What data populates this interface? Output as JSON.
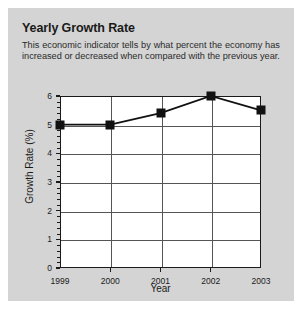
{
  "panel": {
    "title": "Yearly Growth Rate",
    "description_line1": "This economic indicator tells by what percent the economy has",
    "description_line2": "increased or decreased when compared with the previous year.",
    "background_color": "#d4d4d4",
    "plot_background_color": "#ffffff",
    "series_color": "#111111",
    "grid_color": "#555555"
  },
  "chart_data": {
    "type": "line",
    "title": "Yearly Growth Rate",
    "subtitle": "This economic indicator tells by what percent the economy has increased or decreased when compared with the previous year.",
    "xlabel": "Year",
    "ylabel": "Growth Rate (%)",
    "categories": [
      "1999",
      "2000",
      "2001",
      "2002",
      "2003"
    ],
    "values": [
      5.0,
      5.0,
      5.4,
      6.0,
      5.5
    ],
    "series": [
      {
        "name": "Growth Rate",
        "values": [
          5.0,
          5.0,
          5.4,
          6.0,
          5.5
        ],
        "marker": "square",
        "color": "#111111"
      }
    ],
    "ylim": [
      0,
      6
    ],
    "yticks": [
      0,
      1,
      2,
      3,
      4,
      5,
      6
    ],
    "ytick_labels": [
      "0",
      "1",
      "2",
      "3",
      "4",
      "5",
      "6"
    ],
    "yminor_tick_interval": 0.2,
    "xticks": [
      "1999",
      "2000",
      "2001",
      "2002",
      "2003"
    ],
    "grid": true,
    "grid_axis": "both",
    "legend": false,
    "legend_position": "none"
  }
}
